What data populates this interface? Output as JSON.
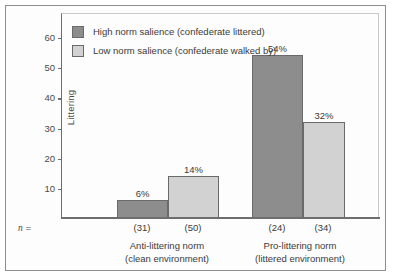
{
  "chart_data": {
    "type": "bar",
    "title": "",
    "xlabel": "",
    "ylabel": "Littering",
    "ylim": [
      0,
      68
    ],
    "yticks": [
      10,
      20,
      30,
      40,
      50,
      60
    ],
    "grid": false,
    "legend_position": "top-left",
    "categories": [
      "Anti-littering norm\n(clean environment)",
      "Pro-littering norm\n(littered environment)"
    ],
    "series": [
      {
        "name": "High norm salience (confederate littered)",
        "color": "#8d8d8d",
        "values": [
          6,
          54
        ],
        "value_labels": [
          "6%",
          "54%"
        ],
        "n": [
          31,
          24
        ],
        "n_labels": [
          "(31)",
          "(34)"
        ]
      },
      {
        "name": "Low norm salience (confederate walked by)",
        "color": "#d2d2d2",
        "values": [
          14,
          32
        ],
        "value_labels": [
          "14%",
          "32%"
        ],
        "n": [
          50,
          34
        ],
        "n_labels": [
          "(50)",
          "(34)"
        ]
      }
    ]
  },
  "legend": {
    "items": [
      {
        "label": "High norm salience (confederate littered)",
        "swatch": "dark"
      },
      {
        "label": "Low norm salience (confederate walked by)",
        "swatch": "light"
      }
    ]
  },
  "axis": {
    "y_label": "Littering",
    "y_ticks": [
      "60",
      "50",
      "40",
      "30",
      "20",
      "10"
    ],
    "n_prefix_label": "n =",
    "n_values": [
      "(31)",
      "(50)",
      "(24)",
      "(34)"
    ],
    "groups": [
      {
        "line1": "Anti-littering norm",
        "line2": "(clean environment)"
      },
      {
        "line1": "Pro-littering norm",
        "line2": "(littered environment)"
      }
    ]
  },
  "bars": [
    {
      "value_label": "6%",
      "series": "dark"
    },
    {
      "value_label": "14%",
      "series": "light"
    },
    {
      "value_label": "54%",
      "series": "dark"
    },
    {
      "value_label": "32%",
      "series": "light"
    }
  ],
  "colors": {
    "dark_bar": "#8d8d8d",
    "light_bar": "#d2d2d2",
    "axis": "#6e6e6e",
    "frame": "#8e8e8e",
    "text": "#3a3a3a"
  }
}
